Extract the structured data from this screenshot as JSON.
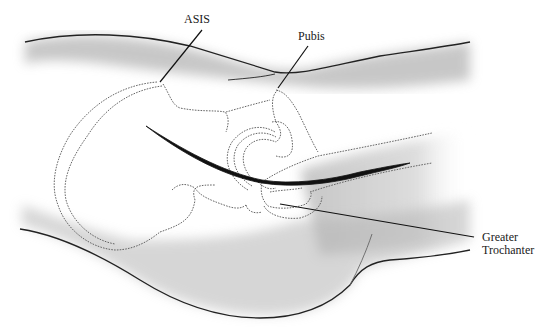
{
  "figure": {
    "type": "anatomical-illustration",
    "labels": [
      {
        "id": "asis",
        "text": "ASIS"
      },
      {
        "id": "pubis",
        "text": "Pubis"
      },
      {
        "id": "greater-trochanter",
        "line1": "Greater",
        "line2": "Trochanter"
      }
    ]
  }
}
